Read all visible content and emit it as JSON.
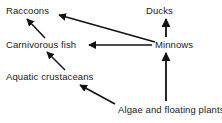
{
  "diagram": {
    "type": "food-web",
    "background_color": "#ffffff",
    "stroke_color": "#111111",
    "text_color": "#1a1a1a",
    "nodes": [
      {
        "id": "raccoons",
        "label": "Raccoons"
      },
      {
        "id": "ducks",
        "label": "Ducks"
      },
      {
        "id": "carnivorous-fish",
        "label": "Carnivorous fish"
      },
      {
        "id": "minnows",
        "label": "Minnows"
      },
      {
        "id": "aquatic-crustaceans",
        "label": "Aquatic crustaceans"
      },
      {
        "id": "algae",
        "label": "Algae and floating plants"
      }
    ],
    "edges": [
      {
        "id": "edge-carnivorous-fish-to-raccoons",
        "from": "carnivorous-fish",
        "to": "raccoons",
        "style": "diagonal-up-left"
      },
      {
        "id": "edge-minnows-to-raccoons",
        "from": "minnows",
        "to": "raccoons",
        "style": "diagonal-up-left-long"
      },
      {
        "id": "edge-minnows-to-ducks",
        "from": "minnows",
        "to": "ducks",
        "style": "vertical-up"
      },
      {
        "id": "edge-minnows-to-carnivorous-fish",
        "from": "minnows",
        "to": "carnivorous-fish",
        "style": "horizontal-left"
      },
      {
        "id": "edge-aquatic-crustaceans-to-carnivorous-fish",
        "from": "aquatic-crustaceans",
        "to": "carnivorous-fish",
        "style": "diagonal-up-left"
      },
      {
        "id": "edge-algae-to-aquatic-crustaceans",
        "from": "algae",
        "to": "aquatic-crustaceans",
        "style": "diagonal-up-left"
      },
      {
        "id": "edge-algae-to-minnows",
        "from": "algae",
        "to": "minnows",
        "style": "vertical-up"
      }
    ]
  }
}
